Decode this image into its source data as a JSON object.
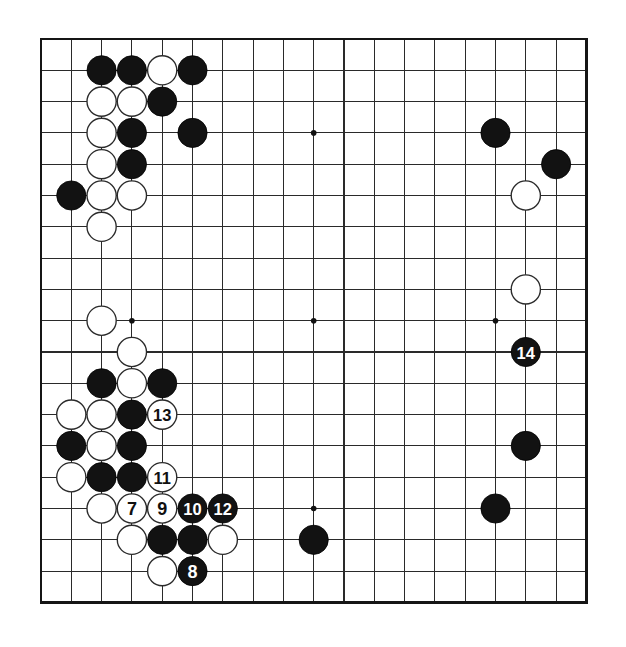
{
  "diagram": {
    "kind": "go-board-diagram",
    "board_size": 19,
    "background_color": "#ffffff",
    "line_color": "#2a2a2a",
    "border_color": "#151515",
    "black_color": "#121212",
    "white_color": "#ffffff",
    "star_points": [
      {
        "col": 4,
        "row": 4
      },
      {
        "col": 10,
        "row": 4
      },
      {
        "col": 16,
        "row": 4
      },
      {
        "col": 4,
        "row": 10
      },
      {
        "col": 10,
        "row": 10
      },
      {
        "col": 16,
        "row": 10
      },
      {
        "col": 4,
        "row": 16
      },
      {
        "col": 10,
        "row": 16
      },
      {
        "col": 16,
        "row": 16
      }
    ],
    "geometry": {
      "origin_x": 41,
      "origin_y": 39,
      "step_x": 30.3,
      "step_y": 31.3,
      "stone_radius": 14.6,
      "star_radius": 2.8
    },
    "stones": [
      {
        "col": 3,
        "row": 2,
        "color": "black",
        "label": ""
      },
      {
        "col": 4,
        "row": 2,
        "color": "black",
        "label": ""
      },
      {
        "col": 5,
        "row": 2,
        "color": "white",
        "label": ""
      },
      {
        "col": 6,
        "row": 2,
        "color": "black",
        "label": ""
      },
      {
        "col": 3,
        "row": 3,
        "color": "white",
        "label": ""
      },
      {
        "col": 4,
        "row": 3,
        "color": "white",
        "label": ""
      },
      {
        "col": 5,
        "row": 3,
        "color": "black",
        "label": ""
      },
      {
        "col": 3,
        "row": 4,
        "color": "white",
        "label": ""
      },
      {
        "col": 4,
        "row": 4,
        "color": "black",
        "label": ""
      },
      {
        "col": 6,
        "row": 4,
        "color": "black",
        "label": ""
      },
      {
        "col": 3,
        "row": 5,
        "color": "white",
        "label": ""
      },
      {
        "col": 4,
        "row": 5,
        "color": "black",
        "label": ""
      },
      {
        "col": 2,
        "row": 6,
        "color": "black",
        "label": ""
      },
      {
        "col": 3,
        "row": 6,
        "color": "white",
        "label": ""
      },
      {
        "col": 4,
        "row": 6,
        "color": "white",
        "label": ""
      },
      {
        "col": 3,
        "row": 7,
        "color": "white",
        "label": ""
      },
      {
        "col": 16,
        "row": 4,
        "color": "black",
        "label": ""
      },
      {
        "col": 18,
        "row": 5,
        "color": "black",
        "label": ""
      },
      {
        "col": 17,
        "row": 6,
        "color": "white",
        "label": ""
      },
      {
        "col": 17,
        "row": 9,
        "color": "white",
        "label": ""
      },
      {
        "col": 17,
        "row": 11,
        "color": "black",
        "label": "14"
      },
      {
        "col": 3,
        "row": 10,
        "color": "white",
        "label": ""
      },
      {
        "col": 4,
        "row": 11,
        "color": "white",
        "label": ""
      },
      {
        "col": 3,
        "row": 12,
        "color": "black",
        "label": ""
      },
      {
        "col": 4,
        "row": 12,
        "color": "white",
        "label": ""
      },
      {
        "col": 5,
        "row": 12,
        "color": "black",
        "label": ""
      },
      {
        "col": 2,
        "row": 13,
        "color": "white",
        "label": ""
      },
      {
        "col": 3,
        "row": 13,
        "color": "white",
        "label": ""
      },
      {
        "col": 4,
        "row": 13,
        "color": "black",
        "label": ""
      },
      {
        "col": 5,
        "row": 13,
        "color": "white",
        "label": "13"
      },
      {
        "col": 2,
        "row": 14,
        "color": "black",
        "label": ""
      },
      {
        "col": 3,
        "row": 14,
        "color": "white",
        "label": ""
      },
      {
        "col": 4,
        "row": 14,
        "color": "black",
        "label": ""
      },
      {
        "col": 2,
        "row": 15,
        "color": "white",
        "label": ""
      },
      {
        "col": 3,
        "row": 15,
        "color": "black",
        "label": ""
      },
      {
        "col": 4,
        "row": 15,
        "color": "black",
        "label": ""
      },
      {
        "col": 5,
        "row": 15,
        "color": "white",
        "label": "11"
      },
      {
        "col": 3,
        "row": 16,
        "color": "white",
        "label": ""
      },
      {
        "col": 4,
        "row": 16,
        "color": "white",
        "label": "7"
      },
      {
        "col": 5,
        "row": 16,
        "color": "white",
        "label": "9"
      },
      {
        "col": 6,
        "row": 16,
        "color": "black",
        "label": "10"
      },
      {
        "col": 7,
        "row": 16,
        "color": "black",
        "label": "12"
      },
      {
        "col": 4,
        "row": 17,
        "color": "white",
        "label": ""
      },
      {
        "col": 5,
        "row": 17,
        "color": "black",
        "label": ""
      },
      {
        "col": 6,
        "row": 17,
        "color": "black",
        "label": ""
      },
      {
        "col": 7,
        "row": 17,
        "color": "white",
        "label": ""
      },
      {
        "col": 5,
        "row": 18,
        "color": "white",
        "label": ""
      },
      {
        "col": 6,
        "row": 18,
        "color": "black",
        "label": "8"
      },
      {
        "col": 10,
        "row": 17,
        "color": "black",
        "label": ""
      },
      {
        "col": 17,
        "row": 14,
        "color": "black",
        "label": ""
      },
      {
        "col": 16,
        "row": 16,
        "color": "black",
        "label": ""
      }
    ]
  }
}
